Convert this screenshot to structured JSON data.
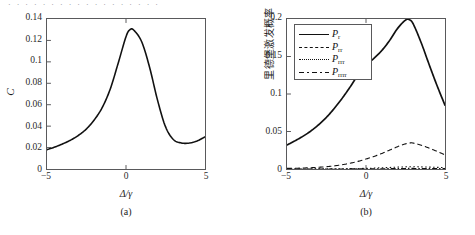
{
  "page": {
    "top_text_sliver": "· · ·  · · · ·  · · · · · ·  · · ·  · ·"
  },
  "panel_a": {
    "caption": "(a)",
    "y_axis_title": "C",
    "x_axis_title": "Δ/γ",
    "y_ticks": [
      "0",
      "0.02",
      "0.04",
      "0.06",
      "0.08",
      "0.1",
      "0.12",
      "0.14"
    ],
    "x_ticks": [
      "−5",
      "0",
      "5"
    ]
  },
  "panel_b": {
    "caption": "(b)",
    "y_axis_title": "里德堡激发概率",
    "x_axis_title": "Δ/γ",
    "y_ticks": [
      "0",
      "0.05",
      "0.1",
      "0.15",
      "0.2"
    ],
    "x_ticks": [
      "−5",
      "0",
      "5"
    ],
    "legend": [
      {
        "label": "P",
        "sub": "r",
        "style": "solid"
      },
      {
        "label": "P",
        "sub": "rr",
        "style": "dashed"
      },
      {
        "label": "P",
        "sub": "rrr",
        "style": "dotted"
      },
      {
        "label": "P",
        "sub": "rrrr",
        "style": "dashdot"
      }
    ]
  },
  "chart_data": [
    {
      "type": "line",
      "title": "(a)",
      "xlabel": "Δ/γ",
      "ylabel": "C",
      "xlim": [
        -5,
        5
      ],
      "ylim": [
        0,
        0.14
      ],
      "grid": false,
      "legend_position": "none",
      "series": [
        {
          "name": "C",
          "style": "solid",
          "color": "#111111",
          "x": [
            -5,
            -4.5,
            -4,
            -3.5,
            -3,
            -2.5,
            -2,
            -1.5,
            -1,
            -0.5,
            0,
            0.25,
            0.5,
            1,
            1.5,
            2,
            2.5,
            3,
            3.5,
            4,
            4.5,
            5
          ],
          "y": [
            0.018,
            0.0205,
            0.0235,
            0.027,
            0.0315,
            0.0375,
            0.046,
            0.0575,
            0.0745,
            0.0985,
            0.1235,
            0.13,
            0.1295,
            0.1185,
            0.0945,
            0.064,
            0.0395,
            0.0275,
            0.0243,
            0.0242,
            0.0262,
            0.03
          ]
        }
      ]
    },
    {
      "type": "line",
      "title": "(b)",
      "xlabel": "Δ/γ",
      "ylabel": "里德堡激发概率",
      "xlim": [
        -5,
        5
      ],
      "ylim": [
        0,
        0.2
      ],
      "grid": false,
      "legend_position": "upper-left",
      "series": [
        {
          "name": "P_r",
          "style": "solid",
          "color": "#111111",
          "x": [
            -5,
            -4.5,
            -4,
            -3.5,
            -3,
            -2.5,
            -2,
            -1.5,
            -1,
            -0.5,
            0,
            0.5,
            1,
            1.5,
            2,
            2.5,
            2.75,
            3,
            3.5,
            4,
            4.5,
            5
          ],
          "y": [
            0.032,
            0.0375,
            0.0435,
            0.0505,
            0.059,
            0.069,
            0.081,
            0.0945,
            0.1095,
            0.1255,
            0.1385,
            0.1475,
            0.158,
            0.1715,
            0.1875,
            0.1985,
            0.199,
            0.193,
            0.168,
            0.139,
            0.111,
            0.085
          ]
        },
        {
          "name": "P_rr",
          "style": "dashed",
          "color": "#111111",
          "x": [
            -5,
            -4.5,
            -4,
            -3.5,
            -3,
            -2.5,
            -2,
            -1.5,
            -1,
            -0.5,
            0,
            0.5,
            1,
            1.5,
            2,
            2.5,
            2.8,
            3,
            3.5,
            4,
            4.5,
            5
          ],
          "y": [
            0.0008,
            0.001,
            0.0013,
            0.0017,
            0.0023,
            0.0031,
            0.0042,
            0.0057,
            0.0077,
            0.0102,
            0.0132,
            0.0167,
            0.0207,
            0.0252,
            0.0298,
            0.0335,
            0.0348,
            0.0345,
            0.0318,
            0.0278,
            0.0235,
            0.0188
          ]
        },
        {
          "name": "P_rrr",
          "style": "dotted",
          "color": "#111111",
          "x": [
            -5,
            -4,
            -3,
            -2,
            -1,
            0,
            1,
            2,
            2.8,
            3.5,
            4.5,
            5
          ],
          "y": [
            5e-05,
            8e-05,
            0.00014,
            0.00026,
            0.0005,
            0.0009,
            0.0016,
            0.0025,
            0.003,
            0.0028,
            0.0022,
            0.0018
          ]
        },
        {
          "name": "P_rrrr",
          "style": "dashdot",
          "color": "#111111",
          "x": [
            -5,
            -4,
            -3,
            -2,
            -1,
            0,
            1,
            2,
            2.8,
            3.5,
            4.5,
            5
          ],
          "y": [
            1e-05,
            2e-05,
            4e-05,
            7e-05,
            0.00013,
            0.00024,
            0.0004,
            0.0006,
            0.0008,
            0.0007,
            0.0006,
            0.0005
          ]
        }
      ]
    }
  ]
}
